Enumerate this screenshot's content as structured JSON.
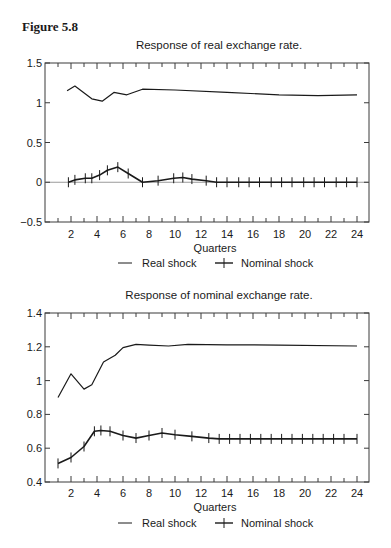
{
  "figure_label": "Figure 5.8",
  "chart_data": [
    {
      "type": "line",
      "title": "Response of real exchange rate.",
      "xlabel": "Quarters",
      "ylabel": "",
      "ylim": [
        -0.5,
        1.5
      ],
      "xlim": [
        0,
        25
      ],
      "yticks": [
        -0.5,
        0,
        0.5,
        1,
        1.5
      ],
      "ytick_labels": [
        "−0.5",
        "0",
        "0.5",
        "1",
        "1.5"
      ],
      "xticks": [
        2,
        4,
        6,
        8,
        10,
        12,
        14,
        16,
        18,
        20,
        22,
        24
      ],
      "zero_line": true,
      "grid": false,
      "legend": [
        "Real shock",
        "Nominal shock"
      ],
      "legend_position": "below",
      "series": [
        {
          "name": "Real shock",
          "marker": "none",
          "x": [
            1.7,
            2.3,
            3.6,
            4.4,
            5.3,
            6.3,
            7.5,
            10,
            14,
            18,
            21,
            24
          ],
          "values": [
            1.15,
            1.21,
            1.05,
            1.02,
            1.13,
            1.1,
            1.17,
            1.16,
            1.13,
            1.1,
            1.09,
            1.1
          ]
        },
        {
          "name": "Nominal shock",
          "marker": "plus",
          "x": [
            1.8,
            2.3,
            3.1,
            3.6,
            4.2,
            4.8,
            5.6,
            6.4,
            7.5,
            8.7,
            9.9,
            10.6,
            11.3,
            12.4,
            13.2,
            14.0,
            14.9,
            15.7,
            16.5,
            17.4,
            18.2,
            19.0,
            19.9,
            20.7,
            21.5,
            22.4,
            23.2,
            24.0
          ],
          "values": [
            0.0,
            0.03,
            0.05,
            0.05,
            0.09,
            0.15,
            0.19,
            0.11,
            0.0,
            0.02,
            0.05,
            0.06,
            0.04,
            0.02,
            0.0,
            0.0,
            0.0,
            0.0,
            0.0,
            0.0,
            0.0,
            0.0,
            0.0,
            0.0,
            0.0,
            0.0,
            0.0,
            0.0
          ]
        }
      ]
    },
    {
      "type": "line",
      "title": "Response of nominal exchange rate.",
      "xlabel": "Quarters",
      "ylabel": "",
      "ylim": [
        0.4,
        1.4
      ],
      "xlim": [
        0,
        25
      ],
      "yticks": [
        0.4,
        0.6,
        0.8,
        1,
        1.2,
        1.4
      ],
      "ytick_labels": [
        "0.4",
        "0.6",
        "0.8",
        "1",
        "1.2",
        "1.4"
      ],
      "xticks": [
        2,
        4,
        6,
        8,
        10,
        12,
        14,
        16,
        18,
        20,
        22,
        24
      ],
      "zero_line": false,
      "grid": false,
      "legend": [
        "Real shock",
        "Nominal shock"
      ],
      "legend_position": "below",
      "series": [
        {
          "name": "Real shock",
          "marker": "none",
          "x": [
            1,
            2,
            3,
            3.6,
            4.5,
            5.4,
            6,
            7,
            8,
            9.5,
            11,
            14,
            18,
            24
          ],
          "values": [
            0.9,
            1.04,
            0.95,
            0.975,
            1.11,
            1.15,
            1.195,
            1.215,
            1.21,
            1.205,
            1.215,
            1.212,
            1.21,
            1.205
          ]
        },
        {
          "name": "Nominal shock",
          "marker": "plus",
          "x": [
            1,
            2,
            3,
            3.8,
            4.3,
            5,
            6,
            7,
            8,
            9,
            10,
            11.3,
            12.6,
            13.4,
            14.2,
            15,
            15.8,
            16.6,
            17.4,
            18.2,
            19,
            19.8,
            20.6,
            21.4,
            22.2,
            23,
            24
          ],
          "values": [
            0.51,
            0.545,
            0.61,
            0.7,
            0.705,
            0.7,
            0.675,
            0.66,
            0.675,
            0.69,
            0.68,
            0.67,
            0.66,
            0.655,
            0.655,
            0.655,
            0.655,
            0.655,
            0.655,
            0.655,
            0.655,
            0.655,
            0.655,
            0.655,
            0.655,
            0.655,
            0.655
          ]
        }
      ]
    }
  ],
  "layout": {
    "charts": [
      {
        "frame": {
          "x0": 45,
          "x1": 369,
          "y_top": 63,
          "y_bot": 222
        },
        "title_y": 49,
        "ticklabel_y": 238,
        "xlabel_y": 252,
        "legend_y": 267
      },
      {
        "frame": {
          "x0": 45,
          "x1": 369,
          "y_top": 313,
          "y_bot": 482
        },
        "title_y": 299,
        "ticklabel_y": 497,
        "xlabel_y": 511,
        "legend_y": 527
      }
    ],
    "colors": {
      "line": "#1a1a1a",
      "frame": "#3a3a3a",
      "zero": "#9a9a9a"
    }
  }
}
